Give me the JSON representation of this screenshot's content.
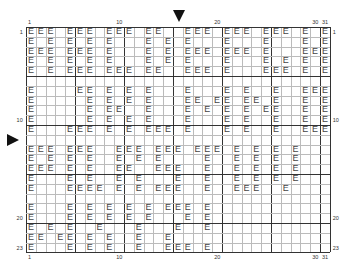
{
  "chart": {
    "symbol": "E",
    "columns": 31,
    "rows": 23,
    "bold_every": 5,
    "column_labels": [
      {
        "col": 1,
        "text": "1"
      },
      {
        "col": 10,
        "text": "10"
      },
      {
        "col": 20,
        "text": "20"
      },
      {
        "col": 30,
        "text": "30"
      },
      {
        "col": 31,
        "text": "31"
      }
    ],
    "row_labels": [
      {
        "row": 1,
        "text": "1"
      },
      {
        "row": 10,
        "text": "10"
      },
      {
        "row": 20,
        "text": "20"
      },
      {
        "row": 23,
        "text": "23"
      }
    ],
    "center_markers": {
      "column": 16,
      "row": 12
    },
    "filled_cells": [
      [
        1,
        2,
        3,
        5,
        6,
        7,
        9,
        10,
        11,
        13,
        14,
        17,
        18,
        19,
        21,
        22,
        23,
        25,
        26,
        27,
        29,
        31
      ],
      [
        1,
        3,
        5,
        7,
        9,
        13,
        15,
        17,
        21,
        25,
        29,
        31
      ],
      [
        1,
        2,
        3,
        5,
        6,
        7,
        9,
        13,
        15,
        17,
        18,
        19,
        21,
        22,
        23,
        25,
        29,
        30,
        31
      ],
      [
        1,
        3,
        5,
        7,
        9,
        13,
        15,
        17,
        21,
        25,
        27,
        29,
        31
      ],
      [
        1,
        3,
        5,
        6,
        7,
        9,
        10,
        11,
        13,
        14,
        17,
        18,
        19,
        21,
        25,
        26,
        27,
        29,
        31
      ],
      [],
      [
        1,
        6,
        7,
        9,
        11,
        13,
        17,
        21,
        23,
        26,
        29,
        30,
        31
      ],
      [
        1,
        7,
        9,
        11,
        13,
        17,
        18,
        20,
        21,
        23,
        24,
        26,
        29,
        31
      ],
      [
        1,
        7,
        9,
        10,
        13,
        17,
        19,
        21,
        23,
        25,
        26,
        29,
        31
      ],
      [
        1,
        7,
        9,
        11,
        13,
        17,
        21,
        23,
        26,
        29,
        31
      ],
      [
        1,
        5,
        6,
        7,
        9,
        11,
        13,
        14,
        15,
        17,
        21,
        23,
        26,
        29,
        30,
        31
      ],
      [],
      [
        1,
        2,
        3,
        5,
        6,
        7,
        10,
        11,
        12,
        14,
        15,
        16,
        18,
        19,
        20,
        22,
        24,
        26,
        28
      ],
      [
        1,
        3,
        5,
        7,
        10,
        12,
        14,
        19,
        22,
        24,
        26,
        28
      ],
      [
        1,
        2,
        3,
        5,
        7,
        10,
        11,
        14,
        15,
        16,
        19,
        22,
        24,
        26,
        28
      ],
      [
        1,
        5,
        7,
        10,
        12,
        16,
        19,
        22,
        24,
        26,
        28
      ],
      [
        1,
        5,
        6,
        7,
        8,
        10,
        12,
        14,
        15,
        16,
        19,
        22,
        23,
        24,
        27
      ],
      [],
      [
        1,
        5,
        7,
        9,
        11,
        13,
        15,
        16,
        17,
        19
      ],
      [
        1,
        5,
        7,
        9,
        11,
        13,
        17,
        19
      ],
      [
        1,
        3,
        5,
        8,
        12,
        16,
        19
      ],
      [
        1,
        2,
        4,
        5,
        7,
        9,
        12,
        15
      ],
      [
        1,
        5,
        7,
        9,
        12,
        15,
        16,
        17,
        19
      ]
    ]
  }
}
